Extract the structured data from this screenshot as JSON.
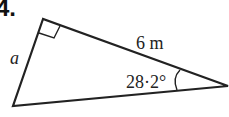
{
  "problem_number": "4.",
  "diagram": {
    "type": "right-triangle",
    "labels": {
      "hypotenuse": "6 m",
      "side": "a",
      "angle": "28·2°"
    },
    "right_angle_marker": true,
    "angle_arc": true,
    "colors": {
      "stroke": "#222222",
      "background": "#ffffff"
    }
  }
}
